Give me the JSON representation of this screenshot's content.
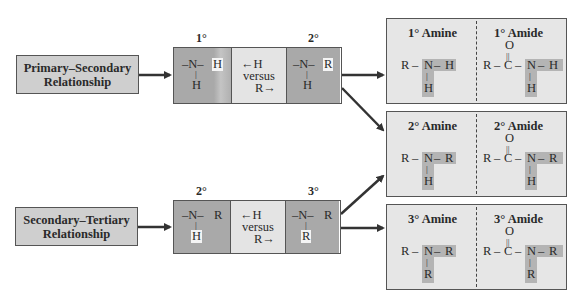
{
  "relationships": [
    {
      "label_line1": "Primary–Secondary",
      "label_line2": "Relationship"
    },
    {
      "label_line1": "Secondary–Tertiary",
      "label_line2": "Relationship"
    }
  ],
  "comparisons": [
    {
      "left_degree": "1°",
      "right_degree": "2°",
      "left_struct": {
        "bond_left": "–N–",
        "sub_right": "H",
        "sub_down": "H"
      },
      "right_struct": {
        "bond_left": "–N–",
        "sub_right": "R",
        "sub_down": "H"
      },
      "middle": {
        "line1": "←H",
        "line2": "versus",
        "line3": "R→"
      }
    },
    {
      "left_degree": "2°",
      "right_degree": "3°",
      "left_struct": {
        "bond_left": "–N–",
        "sub_right": "R",
        "sub_down": "H"
      },
      "right_struct": {
        "bond_left": "–N–",
        "sub_right": "R",
        "sub_down": "R"
      },
      "middle": {
        "line1": "←H",
        "line2": "versus",
        "line3": "R→"
      }
    }
  ],
  "results": [
    {
      "amine_title": "1° Amine",
      "amide_title": "1° Amide",
      "sub_right": "H",
      "sub_down": "H"
    },
    {
      "amine_title": "2° Amine",
      "amide_title": "2° Amide",
      "sub_right": "R",
      "sub_down": "H"
    },
    {
      "amine_title": "3° Amine",
      "amide_title": "3° Amide",
      "sub_right": "R",
      "sub_down": "R"
    }
  ],
  "atoms": {
    "R": "R",
    "N": "N",
    "C": "C",
    "O": "O",
    "dash": "–",
    "double": "||",
    "single": "|"
  },
  "colors": {
    "relationship_box": "#cfcfcf",
    "dark_cell": "#a9a9a9",
    "light_cell": "#e4e4e4",
    "result_box": "#e6e6e6",
    "highlight": "#b4b4b4",
    "arrow": "#333333"
  }
}
